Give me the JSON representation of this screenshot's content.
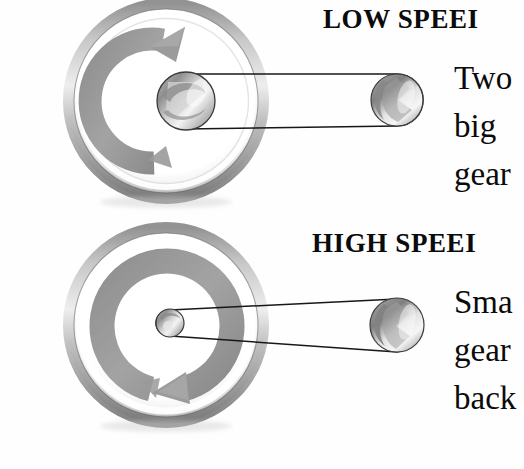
{
  "document": {
    "kind": "instructional-diagram",
    "subject": "bicycle-gear-speed-comparison",
    "background_color": "#fefefe",
    "ink_color": "#0b0b0b"
  },
  "palette": {
    "ink": "#0b0b0b",
    "ring_gray": "#9a9a9a",
    "ring_gray_dark": "#7c7c7c",
    "rim_dark": "#6d6d6d",
    "rim_light": "#e8e8e8",
    "metal_light": "#f2f2f2",
    "metal_mid": "#b4b4b4",
    "metal_dark": "#8c8c8c",
    "belt_line": "#1a1a1a",
    "paper": "#ffffff"
  },
  "panels": [
    {
      "id": "low-speed",
      "heading": "LOW SPEEI",
      "heading_full_intent": "LOW SPEED",
      "heading_clipped": true,
      "caption_lines": [
        "Two",
        "big",
        "gear"
      ],
      "caption_clipped": true,
      "rotation_direction": "clockwise",
      "big_wheel": {
        "cx": 166,
        "cy": 101,
        "r_outer": 98,
        "r_rim_inner": 86,
        "arrow_r": 62,
        "arrow_thickness": 22,
        "arrow_start_deg": 95,
        "arrow_end_deg": 272,
        "arrowhead_at": "top"
      },
      "drive_pulley": {
        "cx": 186,
        "cy": 103,
        "r": 29,
        "label": "large-center-pulley"
      },
      "driven_pulley": {
        "cx": 397,
        "cy": 100,
        "r": 26,
        "label": "large-right-pulley"
      },
      "belt": {
        "top_y_left": 74,
        "bottom_y_left": 132,
        "top_y_right": 74,
        "bottom_y_right": 126,
        "tapered": false
      }
    },
    {
      "id": "high-speed",
      "heading": "HIGH SPEEI",
      "heading_full_intent": "HIGH SPEED",
      "heading_clipped": true,
      "caption_lines": [
        "Sma",
        "gear",
        "back"
      ],
      "caption_clipped": true,
      "rotation_direction": "counterclockwise",
      "big_wheel": {
        "cx": 166,
        "cy": 325,
        "r_outer": 98,
        "r_rim_inner": 86,
        "arrow_r": 64,
        "arrow_thickness": 24,
        "arrow_start_deg": 275,
        "arrow_end_deg": 100,
        "arrowhead_at": "bottom"
      },
      "drive_pulley": {
        "cx": 170,
        "cy": 322,
        "r": 14,
        "label": "small-center-pulley"
      },
      "driven_pulley": {
        "cx": 397,
        "cy": 325,
        "r": 27,
        "label": "small-gear-right-pulley"
      },
      "belt": {
        "top_y_left": 311,
        "bottom_y_left": 335,
        "top_y_right": 300,
        "bottom_y_right": 352,
        "tapered": true
      }
    }
  ],
  "text_blocks": {
    "low_heading": {
      "text": "LOW SPEEI",
      "x": 323,
      "y": 6,
      "size": 27
    },
    "low_line_1": {
      "text": "Two",
      "x": 454,
      "y": 62,
      "size": 33
    },
    "low_line_2": {
      "text": "big",
      "x": 454,
      "y": 110,
      "size": 33
    },
    "low_line_3": {
      "text": "gear",
      "x": 454,
      "y": 158,
      "size": 33
    },
    "high_heading": {
      "text": "HIGH SPEEI",
      "x": 312,
      "y": 230,
      "size": 27
    },
    "high_line_1": {
      "text": "Sma",
      "x": 454,
      "y": 286,
      "size": 33
    },
    "high_line_2": {
      "text": "gear",
      "x": 454,
      "y": 334,
      "size": 33
    },
    "high_line_3": {
      "text": "back",
      "x": 454,
      "y": 382,
      "size": 33
    }
  }
}
